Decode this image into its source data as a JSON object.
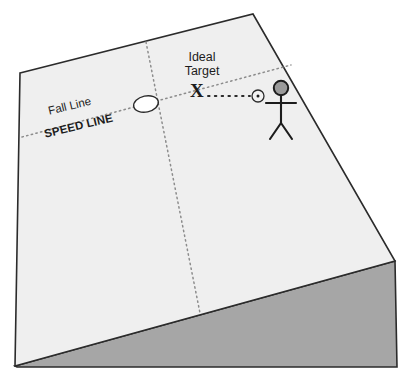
{
  "diagram": {
    "labels": {
      "ideal_target": "Ideal\nTarget",
      "fall_line": "Fall Line",
      "speed_line": "SPEED LINE",
      "x_marker": "X"
    },
    "colors": {
      "slope_top_face": "#efefef",
      "slope_side_face": "#a6a6a6",
      "outline": "#2b2b2b",
      "dotted_line": "#8c8c8c",
      "marker_white": "#ffffff",
      "figure_head_fill": "#9a9a9a",
      "figure_stroke": "#1c1c1c",
      "background": "#ffffff"
    },
    "geometry": {
      "slope_top_face_points": "20,73 253,14 395,261 15,366",
      "slope_side_face_points": "15,366 395,261 397,367 17,367",
      "fall_line_start": [
        22,
        137
      ],
      "fall_line_end": [
        291,
        65
      ],
      "cross_line_start": [
        146,
        42
      ],
      "cross_line_end": [
        200,
        313
      ],
      "sight_line_start": [
        207,
        96
      ],
      "sight_line_end": [
        251,
        96
      ],
      "ellipse_marker_center": [
        146,
        104
      ],
      "target_circle_center": [
        258,
        96
      ],
      "stick_figure_head_center": [
        281,
        89
      ]
    },
    "markers": {
      "intersection_ellipse": "white-ellipse-marker",
      "ideal_target_x": "x-marker",
      "aim_point": "target-circle-marker",
      "skier": "stick-figure"
    }
  }
}
